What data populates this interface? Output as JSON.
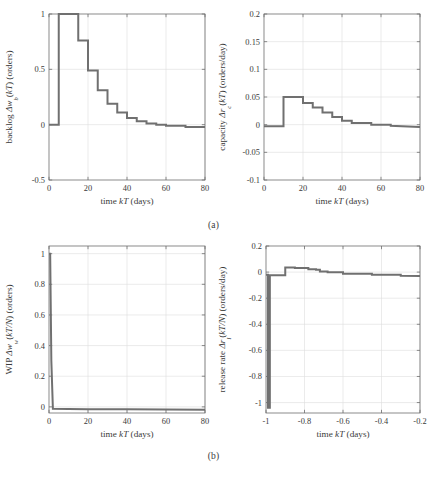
{
  "figure": {
    "subcaption_a": "(a)",
    "subcaption_b": "(b)",
    "curve_color": "#707070",
    "axis_color": "#6e6e6e",
    "grid_color": "#dddddd"
  },
  "chart_data": [
    {
      "id": "backlog",
      "type": "line",
      "step": true,
      "title": "",
      "xlabel": "time kT (days)",
      "ylabel": "backlog Δw_b(kT) (orders)",
      "ylabel_parts": {
        "pre": "backlog ",
        "sym": "Δw",
        "sub": "b",
        "arg": "(kT)",
        "unit": " (orders)"
      },
      "xlim": [
        0,
        80
      ],
      "ylim": [
        -0.5,
        1
      ],
      "xticks": [
        0,
        20,
        40,
        60,
        80
      ],
      "yticks": [
        -0.5,
        0,
        0.5,
        1
      ],
      "xticklabels": [
        "0",
        "20",
        "40",
        "60",
        "80"
      ],
      "yticklabels": [
        "-0.5",
        "0",
        "0.5",
        "1"
      ],
      "grid": true,
      "x": [
        0,
        5,
        5,
        15,
        15,
        20,
        20,
        25,
        25,
        30,
        30,
        35,
        35,
        40,
        40,
        45,
        45,
        50,
        50,
        55,
        55,
        60,
        60,
        70,
        70,
        80
      ],
      "y": [
        0,
        0,
        1.0,
        1.0,
        0.76,
        0.76,
        0.49,
        0.49,
        0.31,
        0.31,
        0.19,
        0.19,
        0.11,
        0.11,
        0.06,
        0.06,
        0.03,
        0.03,
        0.01,
        0.01,
        0.0,
        0.0,
        -0.01,
        -0.01,
        -0.02,
        -0.02
      ]
    },
    {
      "id": "capacity",
      "type": "line",
      "step": true,
      "title": "",
      "xlabel": "time kT (days)",
      "ylabel": "capacity Δr_c(kT) (orders/day)",
      "ylabel_parts": {
        "pre": "capacity ",
        "sym": "Δr",
        "sub": "c",
        "arg": "(kT)",
        "unit": " (orders/day)"
      },
      "xlim": [
        0,
        80
      ],
      "ylim": [
        -0.1,
        0.2
      ],
      "xticks": [
        0,
        20,
        40,
        60,
        80
      ],
      "yticks": [
        -0.1,
        -0.05,
        0,
        0.05,
        0.1,
        0.15,
        0.2
      ],
      "xticklabels": [
        "0",
        "20",
        "40",
        "60",
        "80"
      ],
      "yticklabels": [
        "-0.1",
        "-0.05",
        "0",
        "0.05",
        "0.1",
        "0.15",
        "0.2"
      ],
      "grid": true,
      "x": [
        0,
        10,
        10,
        20,
        20,
        25,
        25,
        30,
        30,
        35,
        35,
        40,
        40,
        45,
        45,
        55,
        55,
        65,
        65,
        80
      ],
      "y": [
        -0.003,
        -0.003,
        0.05,
        0.05,
        0.039,
        0.039,
        0.031,
        0.031,
        0.022,
        0.022,
        0.014,
        0.014,
        0.007,
        0.007,
        0.003,
        0.003,
        0.0,
        0.0,
        -0.002,
        -0.004
      ]
    },
    {
      "id": "wip",
      "type": "line",
      "step": true,
      "title": "",
      "xlabel": "time kT (days)",
      "ylabel": "WIP Δw_w(kT/N) (orders)",
      "ylabel_parts": {
        "pre": "WIP ",
        "sym": "Δw",
        "sub": "w",
        "arg": "(kT/N)",
        "unit": " (orders)"
      },
      "xlim": [
        0,
        80
      ],
      "ylim": [
        -0.04,
        1.05
      ],
      "xticks": [
        0,
        20,
        40,
        60,
        80
      ],
      "yticks": [
        0,
        0.2,
        0.4,
        0.6,
        0.8,
        1
      ],
      "xticklabels": [
        "0",
        "20",
        "40",
        "60",
        "80"
      ],
      "yticklabels": [
        "0",
        "0.2",
        "0.4",
        "0.6",
        "0.8",
        "1"
      ],
      "grid": true,
      "x": [
        0,
        0.6,
        1.2,
        2,
        10,
        20,
        40,
        60,
        80
      ],
      "y": [
        1.0,
        1.0,
        0.3,
        -0.012,
        -0.014,
        -0.015,
        -0.016,
        -0.017,
        -0.018
      ]
    },
    {
      "id": "release-rate",
      "type": "line",
      "step": true,
      "title": "",
      "xlabel": "time kT (days)",
      "ylabel": "release rate Δr_l(kT/N) (orders/day)",
      "ylabel_parts": {
        "pre": "release rate ",
        "sym": "Δr",
        "sub": "l",
        "arg": "(kT/N)",
        "unit": " (orders/day)"
      },
      "xlim": [
        0,
        80
      ],
      "ylim": [
        -1.08,
        0.2
      ],
      "xticks": [
        0,
        20,
        40,
        60,
        80
      ],
      "yticks": [
        -1,
        -0.8,
        -0.6,
        -0.4,
        -0.2,
        0,
        0.2
      ],
      "xticklabels": [
        "-1",
        "-0.8",
        "-0.6",
        "-0.4",
        "-0.2",
        "0",
        "0.2"
      ],
      "yticklabels": [
        "-1",
        "-0.8",
        "-0.6",
        "-0.4",
        "-0.2",
        "0",
        "0.2"
      ],
      "grid": true,
      "x": [
        0,
        1,
        1,
        2,
        2,
        10,
        10,
        15,
        15,
        22,
        22,
        26,
        26,
        28,
        28,
        32,
        32,
        40,
        40,
        55,
        55,
        70,
        70,
        80
      ],
      "y": [
        -0.02,
        -0.02,
        -1.04,
        -1.04,
        -0.025,
        -0.025,
        0.035,
        0.035,
        0.032,
        0.032,
        0.022,
        0.022,
        0.018,
        0.018,
        0.005,
        0.005,
        -0.002,
        -0.002,
        -0.012,
        -0.012,
        -0.02,
        -0.02,
        -0.028,
        -0.03
      ]
    }
  ]
}
